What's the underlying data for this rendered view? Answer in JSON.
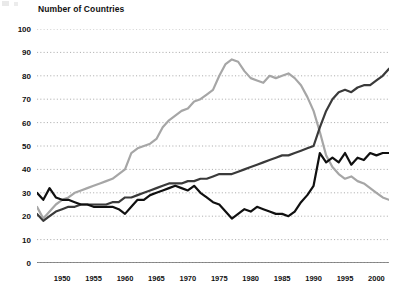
{
  "chart_data": {
    "type": "line",
    "title": "Number of Countries",
    "xlabel": "",
    "ylabel": "Number of Countries",
    "xlim": [
      1946,
      2002
    ],
    "ylim": [
      0,
      100
    ],
    "yticks": [
      0,
      10,
      20,
      30,
      40,
      50,
      60,
      70,
      80,
      90,
      100
    ],
    "ytick_labels": [
      "0",
      "10",
      "20",
      "30",
      "40",
      "50",
      "60",
      "70",
      "80",
      "90",
      "100"
    ],
    "xticks": [
      1950,
      1955,
      1960,
      1965,
      1970,
      1975,
      1980,
      1985,
      1990,
      1995,
      2000
    ],
    "xtick_labels": [
      "1950",
      "1955",
      "1960",
      "1965",
      "1970",
      "1975",
      "1980",
      "1985",
      "1990",
      "1995",
      "2000"
    ],
    "minor_xticks_every": 1,
    "grid": "horizontal-dotted",
    "legend": "none",
    "x": [
      1946,
      1947,
      1948,
      1949,
      1950,
      1951,
      1952,
      1953,
      1954,
      1955,
      1956,
      1957,
      1958,
      1959,
      1960,
      1961,
      1962,
      1963,
      1964,
      1965,
      1966,
      1967,
      1968,
      1969,
      1970,
      1971,
      1972,
      1973,
      1974,
      1975,
      1976,
      1977,
      1978,
      1979,
      1980,
      1981,
      1982,
      1983,
      1984,
      1985,
      1986,
      1987,
      1988,
      1989,
      1990,
      1991,
      1992,
      1993,
      1994,
      1995,
      1996,
      1997,
      1998,
      1999,
      2000,
      2001,
      2002
    ],
    "series": [
      {
        "name": "series-light-gray",
        "color": "#a6a6a6",
        "width": 2.2,
        "values": [
          24,
          19,
          22,
          25,
          27,
          28,
          30,
          31,
          32,
          33,
          34,
          35,
          36,
          38,
          40,
          47,
          49,
          50,
          51,
          53,
          58,
          61,
          63,
          65,
          66,
          69,
          70,
          72,
          74,
          80,
          85,
          87,
          86,
          82,
          79,
          78,
          77,
          80,
          79,
          80,
          81,
          79,
          76,
          71,
          65,
          56,
          46,
          41,
          38,
          36,
          37,
          35,
          34,
          32,
          30,
          28,
          27
        ]
      },
      {
        "name": "series-dark-gray",
        "color": "#3a3a3a",
        "width": 2.2,
        "values": [
          21,
          18,
          20,
          22,
          23,
          24,
          24,
          25,
          25,
          25,
          25,
          25,
          26,
          26,
          28,
          28,
          29,
          30,
          31,
          32,
          33,
          34,
          34,
          34,
          35,
          35,
          36,
          36,
          37,
          38,
          38,
          38,
          39,
          40,
          41,
          42,
          43,
          44,
          45,
          46,
          46,
          47,
          48,
          49,
          50,
          58,
          65,
          70,
          73,
          74,
          73,
          75,
          76,
          76,
          78,
          80,
          83
        ]
      },
      {
        "name": "series-black",
        "color": "#101010",
        "width": 2.2,
        "values": [
          30,
          27,
          32,
          28,
          27,
          27,
          26,
          25,
          25,
          24,
          24,
          24,
          24,
          23,
          21,
          24,
          27,
          27,
          29,
          30,
          31,
          32,
          33,
          32,
          31,
          33,
          30,
          28,
          26,
          25,
          22,
          19,
          21,
          23,
          22,
          24,
          23,
          22,
          21,
          21,
          20,
          22,
          26,
          29,
          33,
          47,
          43,
          45,
          43,
          47,
          42,
          45,
          44,
          47,
          46,
          47,
          47
        ]
      }
    ]
  }
}
